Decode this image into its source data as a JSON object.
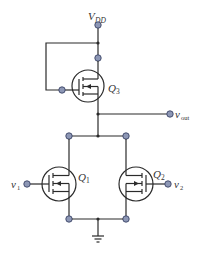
{
  "diagram": {
    "type": "circuit-schematic",
    "colors": {
      "wire": "#2b2b2b",
      "terminal_fill": "#8d97b5",
      "terminal_stroke": "#3b4466",
      "background": "#ffffff"
    },
    "labels": {
      "vdd": {
        "main": "V",
        "sub": "DD"
      },
      "vout": {
        "main": "v",
        "sub": "out"
      },
      "v1": {
        "main": "v",
        "sub": "1"
      },
      "v2": {
        "main": "v",
        "sub": "2"
      },
      "q1": {
        "main": "Q",
        "sub": "1"
      },
      "q2": {
        "main": "Q",
        "sub": "2"
      },
      "q3": {
        "main": "Q",
        "sub": "3"
      }
    },
    "components": [
      {
        "id": "Q3",
        "kind": "p-channel-mosfet",
        "role": "load"
      },
      {
        "id": "Q1",
        "kind": "n-channel-mosfet",
        "input": "v1"
      },
      {
        "id": "Q2",
        "kind": "n-channel-mosfet",
        "input": "v2"
      },
      {
        "id": "GND",
        "kind": "ground"
      }
    ]
  }
}
